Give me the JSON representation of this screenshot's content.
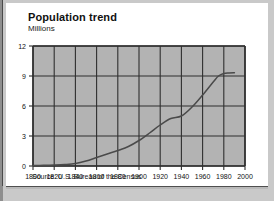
{
  "card": {
    "title": "Population trend",
    "subtitle": "Millions",
    "source": "Source: U.S. Bureau of the Census"
  },
  "chart_data": {
    "type": "line",
    "title": "Population trend",
    "subtitle": "Millions",
    "xlabel": "",
    "ylabel": "Millions",
    "xlim": [
      1800,
      2000
    ],
    "ylim": [
      0,
      12
    ],
    "xticks": [
      1800,
      1820,
      1840,
      1860,
      1880,
      1900,
      1920,
      1940,
      1960,
      1980,
      2000
    ],
    "yticks": [
      0,
      3,
      6,
      9,
      12
    ],
    "grid": true,
    "legend": "none",
    "plot_background": "#b3b3b3",
    "grid_color": "#2f2f2f",
    "line_color": "#4a4a4a",
    "source": "Source: U.S. Bureau of the Census",
    "series": [
      {
        "name": "Population",
        "x": [
          1800,
          1810,
          1820,
          1830,
          1840,
          1850,
          1860,
          1870,
          1880,
          1890,
          1900,
          1910,
          1920,
          1930,
          1940,
          1950,
          1960,
          1970,
          1975,
          1980,
          1985,
          1990
        ],
        "values": [
          0.05,
          0.07,
          0.1,
          0.15,
          0.25,
          0.5,
          0.85,
          1.2,
          1.55,
          1.95,
          2.55,
          3.3,
          4.1,
          4.75,
          5.0,
          5.9,
          7.1,
          8.4,
          9.0,
          9.25,
          9.3,
          9.32
        ]
      }
    ]
  },
  "axis": {
    "y_tick_labels": [
      "12",
      "9",
      "6",
      "3",
      "0"
    ],
    "x_tick_labels": [
      "1800",
      "1820",
      "1840",
      "1860",
      "1880",
      "1900",
      "1920",
      "1940",
      "1960",
      "1980",
      "2000"
    ]
  }
}
